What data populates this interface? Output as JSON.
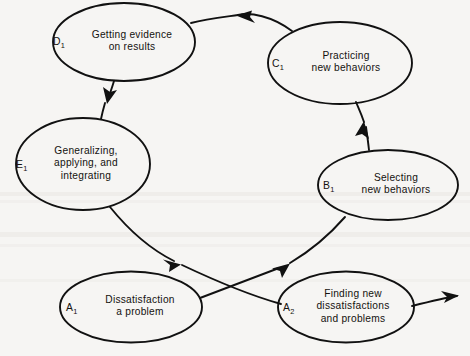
{
  "diagram": {
    "type": "cycle-flow-diagram",
    "background_color": "#f6f5f3",
    "ink_color": "#111111",
    "nodes": [
      {
        "id": "A1",
        "tag": "A",
        "tag_sub": "1",
        "label": "Dissatisfaction\na problem",
        "cx": 131,
        "cy": 307,
        "rx": 71,
        "ry": 35.5
      },
      {
        "id": "A2",
        "tag": "A",
        "tag_sub": "2",
        "label": "Finding new\ndissatisfactions\nand problems",
        "cx": 346,
        "cy": 307,
        "rx": 68,
        "ry": 35.5
      },
      {
        "id": "B1",
        "tag": "B",
        "tag_sub": "1",
        "label": "Selecting\nnew behaviors",
        "cx": 388,
        "cy": 185,
        "rx": 70,
        "ry": 35
      },
      {
        "id": "C1",
        "tag": "C",
        "tag_sub": "1",
        "label": "Practicing\nnew behaviors",
        "cx": 340,
        "cy": 63,
        "rx": 72,
        "ry": 41
      },
      {
        "id": "D1",
        "tag": "D",
        "tag_sub": "1",
        "label": "Getting evidence\non results",
        "cx": 124,
        "cy": 42,
        "rx": 71,
        "ry": 39
      },
      {
        "id": "E1",
        "tag": "E",
        "tag_sub": "1",
        "label": "Generalizing,\napplying, and\nintegrating",
        "cx": 83,
        "cy": 164,
        "rx": 67,
        "ry": 46
      }
    ],
    "edges": [
      {
        "id": "A1-to-B1",
        "from": "A1",
        "to": "B1",
        "arrow": "to"
      },
      {
        "id": "B1-to-C1",
        "from": "B1",
        "to": "C1",
        "arrow": "to"
      },
      {
        "id": "C1-to-D1",
        "from": "C1",
        "to": "D1",
        "arrow": "to"
      },
      {
        "id": "D1-to-E1",
        "from": "D1",
        "to": "E1",
        "arrow": "to"
      },
      {
        "id": "E1-to-A2",
        "from": "E1",
        "to": "A2",
        "arrow": "to"
      },
      {
        "id": "A2-to-next",
        "from": "A2",
        "to": "offscreen-right",
        "arrow": "to"
      }
    ]
  }
}
